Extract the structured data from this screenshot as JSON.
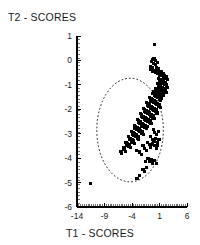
{
  "chart_data": {
    "type": "scatter",
    "title": "T2 - SCORES",
    "subtitle": "",
    "xlabel": "T1 - SCORES",
    "ylabel": "T2 - SCORES",
    "xlim": [
      -14,
      6
    ],
    "ylim": [
      -6,
      1
    ],
    "xticks": [
      -14,
      -9,
      -4,
      1,
      6
    ],
    "yticks": [
      1,
      0,
      -1,
      -2,
      -3,
      -4,
      -5,
      -6
    ],
    "xtick_labels": [
      "-14",
      "-9",
      "-4",
      "1",
      "6"
    ],
    "ytick_labels": [
      "1",
      "0",
      "-1",
      "-2",
      "-3",
      "-4",
      "-5",
      "-6"
    ],
    "grid": false,
    "legend": null,
    "marker": "filled-square",
    "marker_color": "#000000",
    "axis_color": "#000000",
    "annotations": [
      {
        "type": "ellipse",
        "name": "confidence-ellipse",
        "center_x": -4.35,
        "center_y": -2.85,
        "radius_x": 6.05,
        "radius_y": 2.12,
        "rotation_deg": 0,
        "line_style": "dashed",
        "line_color": "#000000"
      }
    ],
    "series": [
      {
        "name": "samples",
        "color": "#000000",
        "points": [
          [
            0.1,
            0.65
          ],
          [
            -0.5,
            -0.05
          ],
          [
            -0.3,
            0.02
          ],
          [
            -0.15,
            -0.12
          ],
          [
            0.0,
            0.08
          ],
          [
            0.2,
            -0.02
          ],
          [
            0.35,
            -0.18
          ],
          [
            0.5,
            -0.3
          ],
          [
            0.62,
            -0.1
          ],
          [
            -0.7,
            -0.25
          ],
          [
            -0.55,
            -0.38
          ],
          [
            -0.35,
            -0.45
          ],
          [
            -0.2,
            -0.3
          ],
          [
            0.05,
            -0.4
          ],
          [
            0.25,
            -0.5
          ],
          [
            0.45,
            -0.42
          ],
          [
            0.6,
            -0.55
          ],
          [
            0.78,
            -0.35
          ],
          [
            0.9,
            -0.48
          ],
          [
            1.05,
            -0.6
          ],
          [
            1.2,
            -0.52
          ],
          [
            1.35,
            -0.45
          ],
          [
            1.5,
            -0.62
          ],
          [
            1.65,
            -0.55
          ],
          [
            1.8,
            -0.68
          ],
          [
            1.95,
            -0.6
          ],
          [
            2.1,
            -0.72
          ],
          [
            2.25,
            -0.65
          ],
          [
            2.4,
            -0.78
          ],
          [
            0.85,
            -0.75
          ],
          [
            1.0,
            -0.85
          ],
          [
            1.15,
            -0.78
          ],
          [
            1.3,
            -0.9
          ],
          [
            1.45,
            -0.82
          ],
          [
            1.6,
            -0.95
          ],
          [
            1.75,
            -0.88
          ],
          [
            1.9,
            -1.0
          ],
          [
            2.05,
            -0.92
          ],
          [
            2.2,
            -1.05
          ],
          [
            2.35,
            -0.98
          ],
          [
            2.5,
            -1.1
          ],
          [
            0.6,
            -0.95
          ],
          [
            0.75,
            -1.05
          ],
          [
            0.9,
            -1.0
          ],
          [
            1.05,
            -1.12
          ],
          [
            1.2,
            -1.05
          ],
          [
            1.35,
            -1.18
          ],
          [
            1.5,
            -1.1
          ],
          [
            1.65,
            -1.22
          ],
          [
            1.8,
            -1.15
          ],
          [
            1.95,
            -1.28
          ],
          [
            2.1,
            -1.2
          ],
          [
            2.25,
            -1.3
          ],
          [
            0.3,
            -1.15
          ],
          [
            0.45,
            -1.25
          ],
          [
            0.6,
            -1.18
          ],
          [
            0.75,
            -1.3
          ],
          [
            0.9,
            -1.22
          ],
          [
            1.05,
            -1.35
          ],
          [
            1.2,
            -1.28
          ],
          [
            1.35,
            -1.4
          ],
          [
            1.5,
            -1.32
          ],
          [
            1.65,
            -1.45
          ],
          [
            1.8,
            -1.38
          ],
          [
            -0.25,
            -1.35
          ],
          [
            -0.1,
            -1.28
          ],
          [
            0.05,
            -1.42
          ],
          [
            0.2,
            -1.35
          ],
          [
            0.35,
            -1.48
          ],
          [
            0.5,
            -1.4
          ],
          [
            0.65,
            -1.52
          ],
          [
            0.8,
            -1.45
          ],
          [
            0.95,
            -1.58
          ],
          [
            1.1,
            -1.5
          ],
          [
            1.25,
            -1.62
          ],
          [
            1.4,
            -1.55
          ],
          [
            -0.85,
            -1.5
          ],
          [
            -0.7,
            -1.62
          ],
          [
            -0.55,
            -1.55
          ],
          [
            -0.4,
            -1.68
          ],
          [
            -0.25,
            -1.6
          ],
          [
            -0.1,
            -1.72
          ],
          [
            0.05,
            -1.65
          ],
          [
            0.2,
            -1.78
          ],
          [
            0.35,
            -1.7
          ],
          [
            0.5,
            -1.82
          ],
          [
            0.65,
            -1.75
          ],
          [
            0.8,
            -1.88
          ],
          [
            0.95,
            -1.8
          ],
          [
            1.1,
            -1.92
          ],
          [
            -1.4,
            -1.72
          ],
          [
            -1.25,
            -1.85
          ],
          [
            -1.1,
            -1.78
          ],
          [
            -0.95,
            -1.9
          ],
          [
            -0.8,
            -1.82
          ],
          [
            -0.65,
            -1.95
          ],
          [
            -0.5,
            -1.88
          ],
          [
            -0.35,
            -2.0
          ],
          [
            -0.2,
            -1.92
          ],
          [
            -0.05,
            -2.05
          ],
          [
            0.1,
            -1.98
          ],
          [
            0.25,
            -2.1
          ],
          [
            0.4,
            -2.02
          ],
          [
            0.55,
            -2.15
          ],
          [
            -1.95,
            -1.95
          ],
          [
            -1.8,
            -2.08
          ],
          [
            -1.65,
            -2.0
          ],
          [
            -1.5,
            -2.12
          ],
          [
            -1.35,
            -2.05
          ],
          [
            -1.2,
            -2.18
          ],
          [
            -1.05,
            -2.1
          ],
          [
            -0.9,
            -2.22
          ],
          [
            -0.75,
            -2.15
          ],
          [
            -0.6,
            -2.28
          ],
          [
            -0.45,
            -2.2
          ],
          [
            -0.3,
            -2.32
          ],
          [
            -0.15,
            -2.25
          ],
          [
            0.0,
            -2.38
          ],
          [
            -2.5,
            -2.18
          ],
          [
            -2.35,
            -2.3
          ],
          [
            -2.2,
            -2.22
          ],
          [
            -2.05,
            -2.35
          ],
          [
            -1.9,
            -2.28
          ],
          [
            -1.75,
            -2.4
          ],
          [
            -1.6,
            -2.32
          ],
          [
            -1.45,
            -2.45
          ],
          [
            -1.3,
            -2.38
          ],
          [
            -1.15,
            -2.5
          ],
          [
            -1.0,
            -2.42
          ],
          [
            -0.85,
            -2.55
          ],
          [
            -0.7,
            -2.48
          ],
          [
            -0.55,
            -2.6
          ],
          [
            -3.05,
            -2.42
          ],
          [
            -2.9,
            -2.55
          ],
          [
            -2.75,
            -2.48
          ],
          [
            -2.6,
            -2.6
          ],
          [
            -2.45,
            -2.52
          ],
          [
            -2.3,
            -2.65
          ],
          [
            -2.15,
            -2.58
          ],
          [
            -2.0,
            -2.7
          ],
          [
            -1.85,
            -2.62
          ],
          [
            -1.7,
            -2.75
          ],
          [
            -1.55,
            -2.68
          ],
          [
            -1.4,
            -2.8
          ],
          [
            -1.25,
            -2.72
          ],
          [
            -3.6,
            -2.65
          ],
          [
            -3.45,
            -2.78
          ],
          [
            -3.3,
            -2.7
          ],
          [
            -3.15,
            -2.82
          ],
          [
            -3.0,
            -2.75
          ],
          [
            -2.85,
            -2.88
          ],
          [
            -2.7,
            -2.8
          ],
          [
            -2.55,
            -2.92
          ],
          [
            -2.4,
            -2.85
          ],
          [
            -2.25,
            -2.98
          ],
          [
            -2.1,
            -2.9
          ],
          [
            -1.95,
            -3.02
          ],
          [
            -4.1,
            -2.9
          ],
          [
            -3.95,
            -3.02
          ],
          [
            -3.8,
            -2.95
          ],
          [
            -3.65,
            -3.08
          ],
          [
            -3.5,
            -3.0
          ],
          [
            -3.35,
            -3.12
          ],
          [
            -3.2,
            -3.05
          ],
          [
            -3.05,
            -3.18
          ],
          [
            -2.9,
            -3.1
          ],
          [
            -2.75,
            -3.22
          ],
          [
            -4.6,
            -3.12
          ],
          [
            -4.45,
            -3.25
          ],
          [
            -4.3,
            -3.18
          ],
          [
            -4.15,
            -3.3
          ],
          [
            -4.0,
            -3.22
          ],
          [
            -3.85,
            -3.35
          ],
          [
            -3.7,
            -3.28
          ],
          [
            -3.55,
            -3.4
          ],
          [
            -5.1,
            -3.35
          ],
          [
            -4.95,
            -3.48
          ],
          [
            -4.8,
            -3.4
          ],
          [
            -4.65,
            -3.52
          ],
          [
            -4.5,
            -3.45
          ],
          [
            -4.35,
            -3.58
          ],
          [
            -5.6,
            -3.58
          ],
          [
            -5.45,
            -3.65
          ],
          [
            -5.3,
            -3.6
          ],
          [
            -5.15,
            -3.72
          ],
          [
            -6.0,
            -3.72
          ],
          [
            -5.85,
            -3.8
          ],
          [
            -0.15,
            -2.82
          ],
          [
            0.15,
            -2.95
          ],
          [
            0.45,
            -3.05
          ],
          [
            0.75,
            -2.9
          ],
          [
            -0.6,
            -3.1
          ],
          [
            -0.3,
            -3.22
          ],
          [
            0.0,
            -3.3
          ],
          [
            0.3,
            -3.18
          ],
          [
            0.6,
            -3.35
          ],
          [
            0.9,
            -3.25
          ],
          [
            -1.2,
            -3.35
          ],
          [
            -0.9,
            -3.45
          ],
          [
            -0.6,
            -3.55
          ],
          [
            -0.3,
            -3.42
          ],
          [
            0.1,
            -3.5
          ],
          [
            0.4,
            -3.62
          ],
          [
            0.7,
            -3.48
          ],
          [
            -2.0,
            -3.5
          ],
          [
            -1.7,
            -3.62
          ],
          [
            -1.4,
            -3.7
          ],
          [
            -2.6,
            -3.75
          ],
          [
            -2.3,
            -3.85
          ],
          [
            -3.2,
            -3.68
          ],
          [
            -1.1,
            -4.0
          ],
          [
            -0.8,
            -4.12
          ],
          [
            -0.5,
            -4.05
          ],
          [
            -0.2,
            -4.2
          ],
          [
            0.1,
            -4.1
          ],
          [
            0.4,
            -4.22
          ],
          [
            -1.5,
            -4.15
          ],
          [
            -2.0,
            -4.45
          ],
          [
            -1.7,
            -4.55
          ],
          [
            -1.4,
            -4.4
          ],
          [
            -2.6,
            -4.72
          ],
          [
            -3.1,
            -4.85
          ],
          [
            -11.5,
            -5.05
          ]
        ]
      }
    ]
  }
}
